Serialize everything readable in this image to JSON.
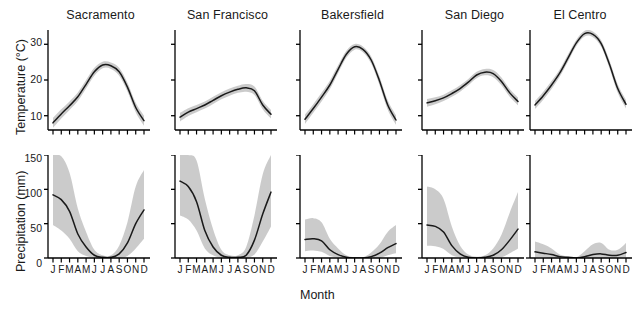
{
  "figure": {
    "xlabel": "Month",
    "month_labels": [
      "J",
      "F",
      "M",
      "A",
      "M",
      "J",
      "J",
      "A",
      "S",
      "O",
      "N",
      "D"
    ],
    "band_color": "#c8c8c8",
    "line_color": "#1a1a1a",
    "axis_color": "#000000"
  },
  "chart_data": {
    "type": "line",
    "title": "",
    "xlabel": "Month",
    "categories": [
      "J",
      "F",
      "M",
      "A",
      "M",
      "J",
      "J",
      "A",
      "S",
      "O",
      "N",
      "D"
    ],
    "grid": false,
    "legend": "none",
    "panels": [
      {
        "city": "Sacramento",
        "temperature": {
          "ylabel": "Temperature (°C)",
          "units": "°C",
          "ylim": [
            6,
            34
          ],
          "yticks": [
            10,
            20,
            30
          ],
          "mean": [
            8.0,
            10.5,
            12.8,
            15.3,
            18.8,
            22.3,
            24.2,
            24.0,
            22.3,
            18.0,
            12.3,
            8.6
          ],
          "lower": [
            6.6,
            9.2,
            11.6,
            14.1,
            17.6,
            21.2,
            23.3,
            23.1,
            21.2,
            16.8,
            11.0,
            7.2
          ],
          "upper": [
            9.4,
            11.8,
            14.0,
            16.5,
            20.0,
            23.4,
            25.1,
            24.9,
            23.4,
            19.2,
            13.6,
            10.0
          ]
        },
        "precipitation": {
          "ylabel": "Precipitation (mm)",
          "units": "mm",
          "ylim": [
            0,
            150
          ],
          "yticks": [
            0,
            50,
            100,
            150
          ],
          "mean": [
            92,
            85,
            68,
            35,
            16,
            4,
            1,
            1,
            6,
            22,
            50,
            70
          ],
          "lower": [
            48,
            40,
            28,
            10,
            3,
            0,
            0,
            0,
            0,
            3,
            14,
            28
          ],
          "upper": [
            150,
            148,
            124,
            72,
            38,
            12,
            4,
            4,
            18,
            52,
            104,
            128
          ]
        }
      },
      {
        "city": "San Francisco",
        "temperature": {
          "units": "°C",
          "ylim": [
            6,
            34
          ],
          "yticks": [
            10,
            20,
            30
          ],
          "mean": [
            9.6,
            11.0,
            12.0,
            13.0,
            14.3,
            15.6,
            16.6,
            17.4,
            17.8,
            17.0,
            13.0,
            10.4
          ],
          "lower": [
            8.4,
            9.9,
            11.0,
            12.0,
            13.3,
            14.6,
            15.6,
            16.4,
            16.7,
            15.8,
            11.8,
            9.2
          ],
          "upper": [
            10.8,
            12.1,
            13.0,
            14.0,
            15.3,
            16.6,
            17.6,
            18.4,
            18.9,
            18.2,
            14.2,
            11.6
          ]
        },
        "precipitation": {
          "units": "mm",
          "ylim": [
            0,
            150
          ],
          "yticks": [
            0,
            50,
            100,
            150
          ],
          "mean": [
            112,
            104,
            82,
            40,
            16,
            4,
            1,
            1,
            4,
            26,
            64,
            96
          ],
          "lower": [
            62,
            56,
            40,
            14,
            4,
            0,
            0,
            0,
            0,
            5,
            24,
            46
          ],
          "upper": [
            150,
            150,
            142,
            86,
            42,
            12,
            4,
            4,
            16,
            62,
            122,
            150
          ]
        }
      },
      {
        "city": "Bakersfield",
        "temperature": {
          "units": "°C",
          "ylim": [
            6,
            34
          ],
          "yticks": [
            10,
            20,
            30
          ],
          "mean": [
            9.0,
            12.0,
            15.2,
            18.6,
            23.0,
            27.2,
            29.3,
            28.6,
            25.6,
            19.8,
            13.0,
            8.8
          ],
          "lower": [
            7.7,
            10.8,
            14.0,
            17.4,
            21.9,
            26.2,
            28.5,
            27.8,
            24.6,
            18.6,
            11.7,
            7.5
          ],
          "upper": [
            10.3,
            13.2,
            16.4,
            19.8,
            24.1,
            28.2,
            30.1,
            29.4,
            26.6,
            21.0,
            14.3,
            10.1
          ]
        },
        "precipitation": {
          "units": "mm",
          "ylim": [
            0,
            150
          ],
          "yticks": [
            0,
            50,
            100,
            150
          ],
          "mean": [
            27,
            28,
            25,
            12,
            5,
            1,
            0,
            0,
            2,
            7,
            15,
            21
          ],
          "lower": [
            10,
            11,
            9,
            3,
            1,
            0,
            0,
            0,
            0,
            0,
            4,
            7
          ],
          "upper": [
            56,
            58,
            52,
            28,
            14,
            4,
            1,
            1,
            8,
            20,
            38,
            48
          ]
        }
      },
      {
        "city": "San Diego",
        "temperature": {
          "units": "°C",
          "ylim": [
            6,
            34
          ],
          "yticks": [
            10,
            20,
            30
          ],
          "mean": [
            13.6,
            14.2,
            15.0,
            16.2,
            17.6,
            19.4,
            21.4,
            22.2,
            21.8,
            19.6,
            16.4,
            14.0
          ],
          "lower": [
            12.5,
            13.2,
            14.1,
            15.3,
            16.7,
            18.5,
            20.5,
            21.3,
            20.8,
            18.5,
            15.3,
            12.9
          ],
          "upper": [
            14.7,
            15.2,
            15.9,
            17.1,
            18.5,
            20.3,
            22.3,
            23.1,
            22.8,
            20.7,
            17.5,
            15.1
          ]
        },
        "precipitation": {
          "units": "mm",
          "ylim": [
            0,
            150
          ],
          "yticks": [
            0,
            50,
            100,
            150
          ],
          "mean": [
            48,
            46,
            38,
            18,
            6,
            1,
            0,
            1,
            4,
            12,
            26,
            42
          ],
          "lower": [
            18,
            17,
            13,
            4,
            1,
            0,
            0,
            0,
            0,
            1,
            7,
            14
          ],
          "upper": [
            104,
            100,
            86,
            46,
            18,
            5,
            2,
            4,
            14,
            34,
            66,
            96
          ]
        }
      },
      {
        "city": "El Centro",
        "temperature": {
          "units": "°C",
          "ylim": [
            6,
            34
          ],
          "yticks": [
            10,
            20,
            30
          ],
          "mean": [
            13.0,
            15.6,
            18.6,
            22.0,
            26.2,
            30.4,
            33.0,
            32.8,
            30.2,
            24.4,
            17.6,
            13.2
          ],
          "lower": [
            11.9,
            14.5,
            17.5,
            21.0,
            25.2,
            29.5,
            32.2,
            32.0,
            29.3,
            23.3,
            16.4,
            12.0
          ],
          "upper": [
            14.1,
            16.7,
            19.7,
            23.0,
            27.2,
            31.3,
            33.8,
            33.6,
            31.1,
            25.5,
            18.8,
            14.4
          ]
        },
        "precipitation": {
          "units": "mm",
          "ylim": [
            0,
            150
          ],
          "yticks": [
            0,
            50,
            100,
            150
          ],
          "mean": [
            9,
            7,
            5,
            2,
            1,
            0,
            2,
            5,
            6,
            4,
            4,
            8
          ],
          "lower": [
            1,
            1,
            0,
            0,
            0,
            0,
            0,
            0,
            0,
            0,
            0,
            1
          ],
          "upper": [
            24,
            20,
            14,
            5,
            2,
            1,
            10,
            20,
            22,
            12,
            12,
            22
          ]
        }
      }
    ]
  }
}
